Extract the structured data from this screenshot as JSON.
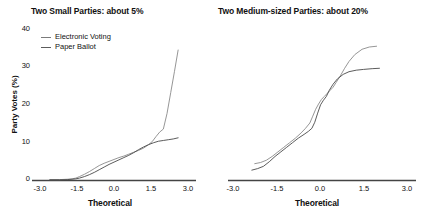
{
  "figure": {
    "background": "#ffffff",
    "line_color_electronic": "#8a8a8a",
    "line_color_paper": "#4a4a4a",
    "axis_color": "#444444"
  },
  "ylabel": "Party Votes (%)",
  "xlabel": "Theoretical",
  "legend": {
    "electronic_label": "Electronic Voting",
    "paper_label": "Paper Ballot"
  },
  "chart_data": [
    {
      "type": "line",
      "title": "Two Small Parties: about 5%",
      "xlabel": "Theoretical",
      "ylabel": "Party Votes (%)",
      "xlim": [
        -3.0,
        3.0
      ],
      "ylim": [
        0,
        42
      ],
      "xticks": [
        -3.0,
        -1.5,
        0.0,
        1.5,
        3.0
      ],
      "xticklabels": [
        "-3.0",
        "-1.5",
        "0.0",
        "1.5",
        "3.0"
      ],
      "yticks": [
        0,
        10,
        20,
        30,
        40
      ],
      "yticklabels": [
        "0",
        "10",
        "20",
        "30",
        "40"
      ],
      "grid": false,
      "legend_position": "upper left",
      "series": [
        {
          "name": "Electronic Voting",
          "color": "#8a8a8a",
          "x": [
            -2.6,
            -2.2,
            -1.9,
            -1.7,
            -1.55,
            -1.4,
            -1.2,
            -1.0,
            -0.8,
            -0.6,
            -0.4,
            -0.2,
            0.0,
            0.2,
            0.4,
            0.6,
            0.8,
            1.0,
            1.2,
            1.4,
            1.55,
            1.7,
            1.85,
            2.0,
            2.15,
            2.3,
            2.45,
            2.6
          ],
          "y": [
            0.1,
            0.1,
            0.2,
            0.3,
            0.5,
            0.9,
            1.5,
            2.2,
            3.0,
            3.8,
            4.4,
            4.9,
            5.4,
            5.9,
            6.3,
            6.8,
            7.3,
            7.8,
            8.4,
            9.3,
            10.1,
            11.4,
            12.6,
            13.4,
            17.5,
            23.0,
            28.5,
            34.2
          ]
        },
        {
          "name": "Paper Ballot",
          "color": "#4a4a4a",
          "x": [
            -2.6,
            -2.2,
            -1.9,
            -1.7,
            -1.55,
            -1.4,
            -1.2,
            -1.0,
            -0.8,
            -0.6,
            -0.4,
            -0.2,
            0.0,
            0.2,
            0.4,
            0.6,
            0.8,
            1.0,
            1.2,
            1.4,
            1.6,
            1.8,
            2.0,
            2.2,
            2.4,
            2.6
          ],
          "y": [
            0.05,
            0.05,
            0.1,
            0.2,
            0.3,
            0.5,
            0.9,
            1.4,
            2.0,
            2.7,
            3.4,
            4.1,
            4.7,
            5.3,
            5.9,
            6.5,
            7.2,
            8.0,
            8.7,
            9.3,
            9.8,
            10.2,
            10.4,
            10.6,
            10.8,
            11.1
          ]
        }
      ]
    },
    {
      "type": "line",
      "title": "Two Medium-sized Parties: about 20%",
      "xlabel": "Theoretical",
      "ylabel": "Party Votes (%)",
      "xlim": [
        -3.0,
        3.0
      ],
      "ylim": [
        0,
        42
      ],
      "xticks": [
        -3.0,
        -1.5,
        0.0,
        1.5,
        3.0
      ],
      "xticklabels": [
        "-3.0",
        "-1.5",
        "0.0",
        "1.5",
        "3.0"
      ],
      "yticks": [
        0,
        10,
        20,
        30,
        40
      ],
      "yticklabels": [
        "0",
        "10",
        "20",
        "30",
        "40"
      ],
      "grid": false,
      "legend_position": "none",
      "series": [
        {
          "name": "Electronic Voting",
          "color": "#8a8a8a",
          "x": [
            -2.25,
            -2.05,
            -1.85,
            -1.65,
            -1.45,
            -1.25,
            -1.05,
            -0.85,
            -0.65,
            -0.5,
            -0.35,
            -0.25,
            -0.15,
            -0.05,
            0.05,
            0.15,
            0.25,
            0.35,
            0.45,
            0.55,
            0.7,
            0.85,
            1.0,
            1.2,
            1.45,
            1.7,
            1.95
          ],
          "y": [
            4.3,
            4.6,
            5.2,
            6.2,
            7.4,
            8.6,
            9.8,
            11.0,
            12.4,
            13.6,
            15.0,
            16.8,
            18.6,
            20.0,
            21.2,
            22.0,
            22.8,
            23.6,
            24.4,
            25.6,
            27.4,
            29.4,
            31.2,
            33.0,
            34.4,
            35.0,
            35.2
          ]
        },
        {
          "name": "Paper Ballot",
          "color": "#4a4a4a",
          "x": [
            -2.35,
            -2.15,
            -1.95,
            -1.75,
            -1.55,
            -1.35,
            -1.15,
            -0.95,
            -0.75,
            -0.55,
            -0.4,
            -0.28,
            -0.18,
            -0.08,
            0.02,
            0.12,
            0.22,
            0.32,
            0.45,
            0.6,
            0.8,
            1.0,
            1.25,
            1.5,
            1.8,
            2.05
          ],
          "y": [
            2.6,
            3.0,
            3.6,
            4.8,
            6.2,
            7.4,
            8.6,
            9.8,
            11.0,
            12.0,
            12.8,
            13.6,
            15.2,
            17.6,
            19.8,
            21.0,
            22.0,
            23.6,
            25.2,
            26.6,
            27.8,
            28.5,
            28.9,
            29.1,
            29.3,
            29.4
          ]
        }
      ]
    }
  ]
}
